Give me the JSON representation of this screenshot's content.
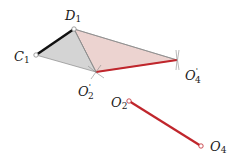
{
  "diagram": {
    "type": "linkage-inversion-construction",
    "colors": {
      "coupler_link": "#111111",
      "ground_link": "#c0262c",
      "triangle_gray_fill": "#d4d4d4",
      "triangle_pink_fill": "#ecd3d0",
      "outline": "#8a8a8a"
    },
    "points": {
      "C1": {
        "x": 36,
        "y": 55,
        "label": "C",
        "sub": "1",
        "sup": ""
      },
      "D1": {
        "x": 74,
        "y": 29,
        "label": "D",
        "sub": "1",
        "sup": ""
      },
      "O2p": {
        "x": 96,
        "y": 72,
        "label": "O",
        "sub": "2",
        "sup": "'"
      },
      "O4p": {
        "x": 177,
        "y": 60,
        "label": "O",
        "sub": "4",
        "sup": "'"
      },
      "O2": {
        "x": 129,
        "y": 101,
        "label": "O",
        "sub": "2",
        "sup": ""
      },
      "O4": {
        "x": 201,
        "y": 146,
        "label": "O",
        "sub": "4",
        "sup": ""
      }
    },
    "labels": {
      "C1": {
        "main": "C",
        "sub": "1"
      },
      "D1": {
        "main": "D",
        "sub": "1"
      },
      "O2p": {
        "main": "O",
        "sup": "'",
        "sub": "2"
      },
      "O4p": {
        "main": "O",
        "sup": "'",
        "sub": "4"
      },
      "O2": {
        "main": "O",
        "sub": "2"
      },
      "O4": {
        "main": "O",
        "sub": "4"
      }
    }
  }
}
